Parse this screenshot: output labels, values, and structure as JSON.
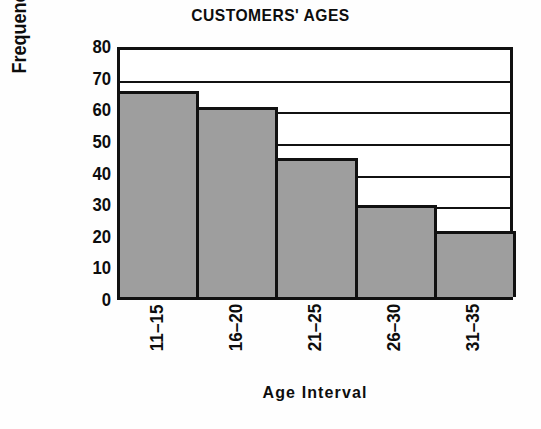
{
  "chart_data": {
    "type": "bar",
    "title": "CUSTOMERS' AGES",
    "xlabel": "Age Interval",
    "ylabel": "Frequency",
    "categories": [
      "11–15",
      "16–20",
      "21–25",
      "26–30",
      "31–35"
    ],
    "values": [
      65,
      60,
      44,
      29,
      21
    ],
    "ylim": [
      0,
      80
    ],
    "yticks": [
      0,
      10,
      20,
      30,
      40,
      50,
      60,
      70,
      80
    ],
    "ytick_labels": [
      "0",
      "10",
      "20",
      "30",
      "40",
      "50",
      "60",
      "70",
      "80"
    ],
    "gridlines": [
      10,
      20,
      30,
      40,
      50,
      60,
      70
    ],
    "grid": true,
    "legend": null,
    "bar_fill_color": "#9e9e9e",
    "bar_edge_color": "#111111",
    "axis_color": "#111111",
    "background_color": "#ffffff",
    "text_color": "#0d0d0d",
    "xtick_rotation": 90
  }
}
